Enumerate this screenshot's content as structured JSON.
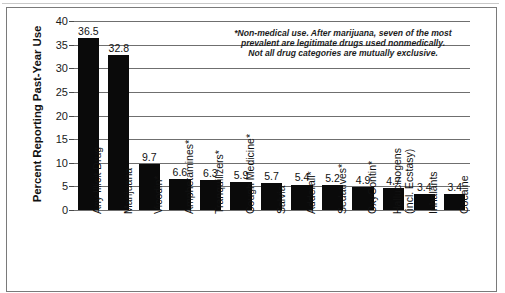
{
  "chart_data": {
    "type": "bar",
    "title": "",
    "xlabel": "",
    "ylabel": "Percent Reporting Past-Year Use",
    "ylim": [
      0,
      40
    ],
    "ytick_step": 5,
    "yticks": [
      "40",
      "35",
      "30",
      "25",
      "20",
      "15",
      "10",
      "5",
      "0"
    ],
    "grid": true,
    "grid_axis": "y",
    "legend": false,
    "bar_color": "#0a0a0a",
    "categories": [
      "Any Illicit Drug",
      "Marijuana",
      "Vicodin*",
      "Amphetamines*",
      "Tranquilizers*",
      "Cough Medicine*",
      "Salvia",
      "Adderall*",
      "Sedatives*",
      "OxyContin*",
      "Hallucinogens (incl. Ecstasy)",
      "Inhalants",
      "Cocaine"
    ],
    "category_lines": [
      [
        "Any Illicit Drug"
      ],
      [
        "Marijuana"
      ],
      [
        "Vicodin*"
      ],
      [
        "Amphetamines*"
      ],
      [
        "Tranquilizers*"
      ],
      [
        "Cough Medicine*"
      ],
      [
        "Salvia"
      ],
      [
        "Adderall*"
      ],
      [
        "Sedatives*"
      ],
      [
        "OxyContin*"
      ],
      [
        "Hallucinogens",
        "(incl. Ecstasy)"
      ],
      [
        "Inhalants"
      ],
      [
        "Cocaine"
      ]
    ],
    "values": [
      36.5,
      32.8,
      9.7,
      6.6,
      6.3,
      5.9,
      5.7,
      5.4,
      5.2,
      4.9,
      4.7,
      3.4,
      3.4
    ],
    "value_labels": [
      "36.5",
      "32.8",
      "9.7",
      "6.6",
      "6.3",
      "5.9",
      "5.7",
      "5.4",
      "5.2",
      "4.9",
      "4.7",
      "3.4",
      "3.4"
    ]
  },
  "annotation": {
    "line1": "*Non-medical use. After marijuana, seven of the most",
    "line2": "prevalent are legitimate drugs used nonmedically.",
    "line3": "Not all drug categories are mutually exclusive."
  }
}
